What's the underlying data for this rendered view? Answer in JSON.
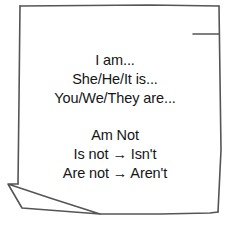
{
  "note": {
    "block_affirmative": {
      "lines": [
        "I am...",
        "She/He/It is...",
        "You/We/They are..."
      ]
    },
    "block_negative": {
      "lines": [
        "Am Not",
        "Is not → Isn't",
        "Are not → Aren't"
      ]
    }
  },
  "colors": {
    "outline": "#555555",
    "text": "#151515",
    "background": "#ffffff"
  }
}
